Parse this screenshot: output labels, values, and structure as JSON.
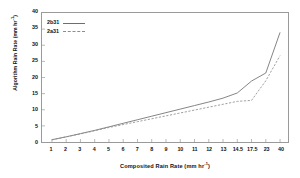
{
  "chart_data": {
    "type": "line",
    "title": "",
    "xlabel": "Composited Rain Rate (mm hr-1)",
    "ylabel": "Algorithm Rain Rate (mm hr-1)",
    "xlabel_base": "Composited Rain Rate (mm hr",
    "xlabel_exp": "-1",
    "xlabel_tail": ")",
    "ylabel_base": "Algorithm Rain Rate (mm hr",
    "ylabel_exp": "-1",
    "ylabel_tail": ")",
    "categories": [
      "1",
      "2",
      "3",
      "4",
      "5",
      "6",
      "7",
      "8",
      "9",
      "10",
      "11",
      "12",
      "13",
      "14.5",
      "17.5",
      "23",
      "40"
    ],
    "x_tick_labels": [
      "1",
      "2",
      "3",
      "4",
      "5",
      "6",
      "7",
      "8",
      "9",
      "10",
      "11",
      "12",
      "13",
      "14.5",
      "17.5",
      "23",
      "40"
    ],
    "y_tick_labels": [
      "0",
      "5",
      "10",
      "15",
      "20",
      "25",
      "30",
      "35",
      "40"
    ],
    "y_ticks": [
      0,
      5,
      10,
      15,
      20,
      25,
      30,
      35,
      40
    ],
    "ylim": [
      0,
      40
    ],
    "grid": false,
    "legend_position": "top-left",
    "series": [
      {
        "name": "2b31",
        "style": "solid",
        "color": "#6e6e6e",
        "values": [
          0.7,
          1.6,
          2.6,
          3.6,
          4.7,
          5.8,
          6.9,
          8.0,
          9.1,
          10.2,
          11.3,
          12.4,
          13.6,
          15.2,
          18.9,
          21.4,
          34.0
        ]
      },
      {
        "name": "2a31",
        "style": "dashed",
        "color": "#8d8d8d",
        "values": [
          0.7,
          1.6,
          2.5,
          3.5,
          4.5,
          5.4,
          6.3,
          7.2,
          8.1,
          9.0,
          9.9,
          10.8,
          11.7,
          12.6,
          12.9,
          19.0,
          26.8
        ]
      }
    ]
  },
  "legend": {
    "items": [
      {
        "label": "2b31",
        "style": "solid"
      },
      {
        "label": "2a31",
        "style": "dashed"
      }
    ]
  }
}
